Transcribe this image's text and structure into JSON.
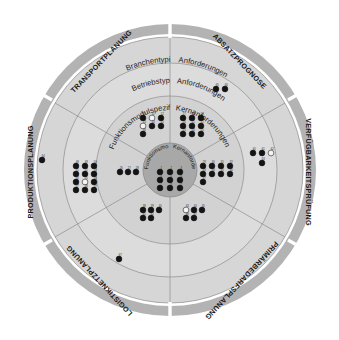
{
  "figure": {
    "type": "concentric-ring-wheel"
  },
  "colors": {
    "outer_band": "#b3b3b3",
    "ring_4": "#d4d4d4",
    "ring_3": "#dcdcdc",
    "ring_2": "#d0d0d0",
    "ring_1_core": "#a8a8a8",
    "divider": "#8c8c8c",
    "dot_filled": "#141414",
    "dot_open": "#f4f4f4",
    "background": "#ffffff"
  },
  "outer_band": {
    "name": "planning-function-band",
    "segments": [
      {
        "id": "transportplanung",
        "label": "TRANSPORTPLANUNG",
        "angle_deg": -57
      },
      {
        "id": "absatzprognose",
        "label": "ABSATZPROGNOSE",
        "angle_deg": -12
      },
      {
        "id": "verfuegbarkeitspruefung",
        "label": "VERFÜGBARKEITSPRÜFUNG",
        "angle_deg": 35
      },
      {
        "id": "primaerbedarfsplanung",
        "label": "PRIMÄRBEDARFSPLANUNG",
        "angle_deg": 82
      },
      {
        "id": "logistiknetzplanung",
        "label": "LOGISTIKNETZPLANUNG",
        "angle_deg": 130
      },
      {
        "id": "produktionsplanung",
        "label": "PRODUKTIONSPLANUNG",
        "angle_deg": 178
      }
    ]
  },
  "rings": [
    {
      "id": "ring-branchentypische",
      "index": 4,
      "label_left": "Branchentypische",
      "label_right": "Anforderungen",
      "full_label": "Branchentypische Anforderungen"
    },
    {
      "id": "ring-betriebstypische",
      "index": 3,
      "label_left": "Betriebstypische",
      "label_right": "Anforderungen",
      "full_label": "Betriebstypische Anforderungen"
    },
    {
      "id": "ring-funktionsmodulspezifische",
      "index": 2,
      "label_left": "Funktionsmodulspezifische",
      "label_right": "Kernanforderungen",
      "full_label": "Funktionsmodulspezifische Kernanforderungen"
    },
    {
      "id": "ring-core",
      "index": 1,
      "label_left": "Funktionsmodulunabhängige",
      "label_right": "Kernanforderungen",
      "full_label": "Funktionsmodulunabhängige Kernanforderungen"
    }
  ],
  "chart_data": {
    "type": "scatter",
    "legend": [
      {
        "marker": "filled",
        "label": "Anforderung erfüllt"
      },
      {
        "marker": "open",
        "label": "Anforderung nicht erfüllt"
      }
    ],
    "clusters": [
      {
        "id": "core-cluster",
        "ring": "ring-core",
        "cx": 170,
        "cy": 178,
        "dots": [
          {
            "n": "1",
            "state": "filled",
            "dx": -10,
            "dy": -6
          },
          {
            "n": "2",
            "state": "filled",
            "dx": 0,
            "dy": -6
          },
          {
            "n": "3",
            "state": "filled",
            "dx": 10,
            "dy": -6
          },
          {
            "n": "4",
            "state": "filled",
            "dx": -10,
            "dy": 2
          },
          {
            "n": "5",
            "state": "filled",
            "dx": 0,
            "dy": 2
          },
          {
            "n": "6",
            "state": "filled",
            "dx": 10,
            "dy": 2
          },
          {
            "n": "7",
            "state": "filled",
            "dx": -10,
            "dy": 10
          },
          {
            "n": "8",
            "state": "filled",
            "dx": 0,
            "dy": 10
          },
          {
            "n": "9",
            "state": "filled",
            "dx": 10,
            "dy": 10
          }
        ]
      },
      {
        "id": "fm-top-left-cluster",
        "ring": "ring-funktionsmodulspezifische",
        "cx": 152,
        "cy": 126,
        "dots": [
          {
            "n": "10",
            "state": "filled",
            "dx": -9,
            "dy": -8
          },
          {
            "n": "11",
            "state": "open",
            "dx": 0,
            "dy": -8
          },
          {
            "n": "12",
            "state": "filled",
            "dx": 9,
            "dy": -8
          },
          {
            "n": "13",
            "state": "open",
            "dx": -9,
            "dy": 0
          },
          {
            "n": "14",
            "state": "filled",
            "dx": 0,
            "dy": 0
          },
          {
            "n": "15",
            "state": "filled",
            "dx": 9,
            "dy": 0
          },
          {
            "n": "16",
            "state": "filled",
            "dx": -9,
            "dy": 8
          }
        ]
      },
      {
        "id": "fm-top-right-cluster",
        "ring": "ring-funktionsmodulspezifische",
        "cx": 192,
        "cy": 126,
        "dots": [
          {
            "n": "17",
            "state": "filled",
            "dx": -9,
            "dy": -8
          },
          {
            "n": "18",
            "state": "filled",
            "dx": 0,
            "dy": -8
          },
          {
            "n": "19",
            "state": "filled",
            "dx": 9,
            "dy": -8
          },
          {
            "n": "20",
            "state": "filled",
            "dx": -9,
            "dy": 0
          },
          {
            "n": "21",
            "state": "filled",
            "dx": 0,
            "dy": 0
          },
          {
            "n": "22",
            "state": "filled",
            "dx": 9,
            "dy": 0
          },
          {
            "n": "23",
            "state": "filled",
            "dx": -9,
            "dy": 8
          },
          {
            "n": "24",
            "state": "filled",
            "dx": 0,
            "dy": 8
          },
          {
            "n": "25",
            "state": "filled",
            "dx": 9,
            "dy": 8
          }
        ]
      },
      {
        "id": "fm-left-cluster",
        "ring": "ring-funktionsmodulspezifische",
        "cx": 128,
        "cy": 172,
        "dots": [
          {
            "n": "26",
            "state": "filled",
            "dx": -8,
            "dy": 0
          },
          {
            "n": "27",
            "state": "filled",
            "dx": 0,
            "dy": 0
          },
          {
            "n": "28",
            "state": "filled",
            "dx": 8,
            "dy": 0
          }
        ]
      },
      {
        "id": "fm-right-cluster",
        "ring": "ring-funktionsmodulspezifische",
        "cx": 216,
        "cy": 172,
        "dots": [
          {
            "n": "29",
            "state": "filled",
            "dx": -13,
            "dy": -6
          },
          {
            "n": "30",
            "state": "filled",
            "dx": -4,
            "dy": -6
          },
          {
            "n": "31",
            "state": "filled",
            "dx": 5,
            "dy": -6
          },
          {
            "n": "32",
            "state": "filled",
            "dx": 14,
            "dy": -6
          },
          {
            "n": "33",
            "state": "filled",
            "dx": -13,
            "dy": 2
          },
          {
            "n": "34",
            "state": "filled",
            "dx": -4,
            "dy": 2
          },
          {
            "n": "35",
            "state": "filled",
            "dx": 5,
            "dy": 2
          },
          {
            "n": "36",
            "state": "filled",
            "dx": 14,
            "dy": 2
          },
          {
            "n": "37",
            "state": "filled",
            "dx": -13,
            "dy": 10
          }
        ]
      },
      {
        "id": "fm-bottom-left-cluster",
        "ring": "ring-funktionsmodulspezifische",
        "cx": 151,
        "cy": 214,
        "dots": [
          {
            "n": "38",
            "state": "filled",
            "dx": -8,
            "dy": -4
          },
          {
            "n": "39",
            "state": "filled",
            "dx": 0,
            "dy": -4
          },
          {
            "n": "40",
            "state": "filled",
            "dx": 8,
            "dy": -4
          },
          {
            "n": "41",
            "state": "filled",
            "dx": -8,
            "dy": 4
          },
          {
            "n": "42",
            "state": "filled",
            "dx": 0,
            "dy": 4
          }
        ]
      },
      {
        "id": "fm-bottom-right-cluster",
        "ring": "ring-funktionsmodulspezifische",
        "cx": 193,
        "cy": 214,
        "dots": [
          {
            "n": "43",
            "state": "open",
            "dx": -7,
            "dy": -4
          },
          {
            "n": "44",
            "state": "filled",
            "dx": 1,
            "dy": -4
          },
          {
            "n": "45",
            "state": "filled",
            "dx": 9,
            "dy": -4
          },
          {
            "n": "46",
            "state": "filled",
            "dx": -7,
            "dy": 4
          },
          {
            "n": "47",
            "state": "filled",
            "dx": 1,
            "dy": 4
          }
        ]
      },
      {
        "id": "bt-left-cluster",
        "ring": "ring-betriebstypische",
        "cx": 85,
        "cy": 180,
        "dots": [
          {
            "n": "48",
            "state": "filled",
            "dx": -9,
            "dy": -14
          },
          {
            "n": "49",
            "state": "filled",
            "dx": 0,
            "dy": -14
          },
          {
            "n": "50",
            "state": "filled",
            "dx": 9,
            "dy": -14
          },
          {
            "n": "51",
            "state": "filled",
            "dx": -9,
            "dy": -6
          },
          {
            "n": "52",
            "state": "filled",
            "dx": 0,
            "dy": -6
          },
          {
            "n": "53",
            "state": "filled",
            "dx": 9,
            "dy": -6
          },
          {
            "n": "54",
            "state": "filled",
            "dx": -9,
            "dy": 2
          },
          {
            "n": "55",
            "state": "open",
            "dx": 0,
            "dy": 2
          },
          {
            "n": "56",
            "state": "filled",
            "dx": 9,
            "dy": 2
          },
          {
            "n": "57",
            "state": "filled",
            "dx": -9,
            "dy": 10
          },
          {
            "n": "58",
            "state": "filled",
            "dx": 0,
            "dy": 10
          },
          {
            "n": "59",
            "state": "filled",
            "dx": 9,
            "dy": 10
          }
        ]
      },
      {
        "id": "bt-right-cluster",
        "ring": "ring-betriebstypische",
        "cx": 262,
        "cy": 157,
        "dots": [
          {
            "n": "60",
            "state": "filled",
            "dx": -9,
            "dy": -4
          },
          {
            "n": "61",
            "state": "filled",
            "dx": 0,
            "dy": -4
          },
          {
            "n": "62",
            "state": "open",
            "dx": 9,
            "dy": -4
          },
          {
            "n": "63",
            "state": "filled",
            "dx": 0,
            "dy": 6
          }
        ]
      },
      {
        "id": "bt-far-left-dot",
        "ring": "ring-betriebstypische",
        "cx": 42,
        "cy": 160,
        "dots": [
          {
            "n": "64",
            "state": "filled",
            "dx": 0,
            "dy": 0
          }
        ]
      },
      {
        "id": "br-top-right-cluster",
        "ring": "ring-branchentypische",
        "cx": 221,
        "cy": 89,
        "dots": [
          {
            "n": "65",
            "state": "filled",
            "dx": -5,
            "dy": 0
          },
          {
            "n": "66",
            "state": "filled",
            "dx": 4,
            "dy": 0
          }
        ]
      },
      {
        "id": "br-bottom-left-dot",
        "ring": "ring-branchentypische",
        "cx": 119,
        "cy": 259,
        "dots": [
          {
            "n": "67",
            "state": "filled",
            "dx": 0,
            "dy": 0
          }
        ]
      }
    ]
  }
}
